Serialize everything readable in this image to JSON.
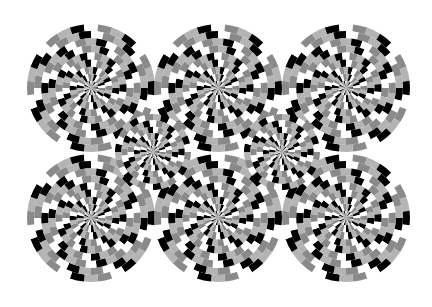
{
  "image": {
    "title": "Rotating snakes optical illusion",
    "background": "#ffffff",
    "palette": [
      "#000000",
      "#ffffff",
      "#8a8a8a",
      "#b4b4b4"
    ],
    "disks": [
      {
        "cx": 91,
        "cy": 88,
        "r": 64
      },
      {
        "cx": 218,
        "cy": 88,
        "r": 64
      },
      {
        "cx": 346,
        "cy": 88,
        "r": 64
      },
      {
        "cx": 91,
        "cy": 218,
        "r": 64
      },
      {
        "cx": 218,
        "cy": 218,
        "r": 64
      },
      {
        "cx": 346,
        "cy": 218,
        "r": 64
      },
      {
        "cx": 153,
        "cy": 152,
        "r": 38
      },
      {
        "cx": 282,
        "cy": 152,
        "r": 38
      }
    ]
  }
}
